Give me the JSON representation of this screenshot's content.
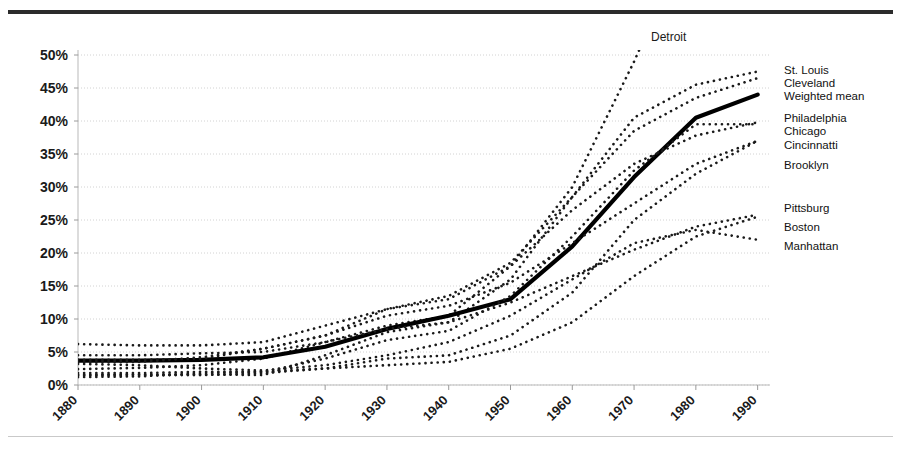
{
  "figure": {
    "top_rule_color": "#2b2b2b",
    "bottom_rule_color": "#c9c9c9",
    "background": "#ffffff"
  },
  "detroit_callout": {
    "label": "Detroit"
  },
  "right_labels": [
    {
      "name": "st-louis",
      "label": "St. Louis",
      "x": 784,
      "y": 64
    },
    {
      "name": "cleveland",
      "label": "Cleveland",
      "x": 784,
      "y": 77
    },
    {
      "name": "weighted-mean",
      "label": "Weighted mean",
      "x": 784,
      "y": 90
    },
    {
      "name": "philadelphia",
      "label": "Philadelphia",
      "x": 784,
      "y": 112
    },
    {
      "name": "chicago",
      "label": "Chicago",
      "x": 784,
      "y": 125
    },
    {
      "name": "cincinnatti",
      "label": "Cincinnatti",
      "x": 784,
      "y": 139
    },
    {
      "name": "brooklyn",
      "label": "Brooklyn",
      "x": 784,
      "y": 159
    },
    {
      "name": "pittsburg",
      "label": "Pittsburg",
      "x": 784,
      "y": 202
    },
    {
      "name": "boston",
      "label": "Boston",
      "x": 784,
      "y": 221
    },
    {
      "name": "manhattan",
      "label": "Manhattan",
      "x": 784,
      "y": 240
    }
  ],
  "chart_data": {
    "type": "line",
    "title": "",
    "subtitle": "",
    "xlabel": "",
    "ylabel": "",
    "xlim": [
      1880,
      1992
    ],
    "ylim": [
      0,
      50
    ],
    "ytick_format": "percent",
    "ytick_labels": [
      "0%",
      "5%",
      "10%",
      "15%",
      "20%",
      "25%",
      "30%",
      "35%",
      "40%",
      "45%",
      "50%"
    ],
    "ytick_values": [
      0,
      5,
      10,
      15,
      20,
      25,
      30,
      35,
      40,
      45,
      50
    ],
    "xtick_labels": [
      "1880",
      "1890",
      "1900",
      "1910",
      "1920",
      "1930",
      "1940",
      "1950",
      "1960",
      "1970",
      "1980",
      "1990"
    ],
    "xtick_values": [
      1880,
      1890,
      1900,
      1910,
      1920,
      1930,
      1940,
      1950,
      1960,
      1970,
      1980,
      1990
    ],
    "xtick_rotation_deg": -45,
    "grid": "horizontal-dotted",
    "legend_position": "right-of-line-ends",
    "x": [
      1880,
      1890,
      1900,
      1910,
      1920,
      1930,
      1940,
      1950,
      1960,
      1970,
      1980,
      1990
    ],
    "series": [
      {
        "name": "Detroit",
        "style": "dotted",
        "color": "#1a1a1a",
        "clipped_above_axis": true,
        "values": [
          2.4,
          2.6,
          3.0,
          4.0,
          6.5,
          9.0,
          10.5,
          18.0,
          30.0,
          49.0,
          70.0,
          78.0
        ]
      },
      {
        "name": "St. Louis",
        "style": "dotted",
        "color": "#1a1a1a",
        "values": [
          6.2,
          6.0,
          6.0,
          6.5,
          9.0,
          11.5,
          13.5,
          18.5,
          28.5,
          40.5,
          45.5,
          47.5
        ]
      },
      {
        "name": "Cleveland",
        "style": "dotted",
        "color": "#1a1a1a",
        "values": [
          1.5,
          1.6,
          1.6,
          1.5,
          4.5,
          8.0,
          9.5,
          16.0,
          28.5,
          38.5,
          43.5,
          46.5
        ]
      },
      {
        "name": "Weighted mean",
        "style": "solid-thick",
        "color": "#000000",
        "values": [
          3.7,
          3.7,
          3.8,
          4.2,
          5.8,
          8.5,
          10.5,
          13.0,
          21.0,
          31.5,
          40.5,
          44.0
        ]
      },
      {
        "name": "Philadelphia",
        "style": "dotted",
        "color": "#1a1a1a",
        "values": [
          3.8,
          3.8,
          4.0,
          5.5,
          7.5,
          11.5,
          13.0,
          18.0,
          26.5,
          33.5,
          37.8,
          39.8
        ]
      },
      {
        "name": "Chicago",
        "style": "dotted",
        "color": "#1a1a1a",
        "values": [
          1.2,
          1.3,
          1.8,
          2.0,
          4.0,
          6.8,
          8.2,
          13.5,
          22.5,
          32.5,
          39.5,
          39.5
        ]
      },
      {
        "name": "Cincinnatti",
        "style": "dotted",
        "color": "#1a1a1a",
        "values": [
          3.5,
          3.5,
          4.2,
          5.5,
          7.5,
          10.5,
          12.0,
          15.5,
          21.5,
          27.5,
          33.5,
          37.0
        ]
      },
      {
        "name": "Brooklyn",
        "style": "dotted",
        "color": "#1a1a1a",
        "values": [
          1.5,
          1.5,
          1.5,
          1.8,
          2.5,
          4.0,
          4.5,
          7.5,
          14.0,
          25.0,
          32.0,
          37.0
        ]
      },
      {
        "name": "Pittsburg",
        "style": "dotted",
        "color": "#1a1a1a",
        "values": [
          4.5,
          4.5,
          4.8,
          5.0,
          6.5,
          8.5,
          9.5,
          12.5,
          16.5,
          20.5,
          24.0,
          25.8
        ]
      },
      {
        "name": "Boston",
        "style": "dotted",
        "color": "#1a1a1a",
        "values": [
          1.8,
          1.8,
          2.0,
          2.0,
          2.5,
          3.0,
          3.5,
          5.5,
          9.5,
          16.5,
          22.5,
          25.5
        ]
      },
      {
        "name": "Manhattan",
        "style": "dotted",
        "color": "#1a1a1a",
        "values": [
          3.2,
          3.0,
          2.5,
          2.2,
          3.0,
          4.5,
          6.5,
          10.5,
          16.0,
          21.5,
          23.5,
          22.0
        ]
      }
    ]
  }
}
